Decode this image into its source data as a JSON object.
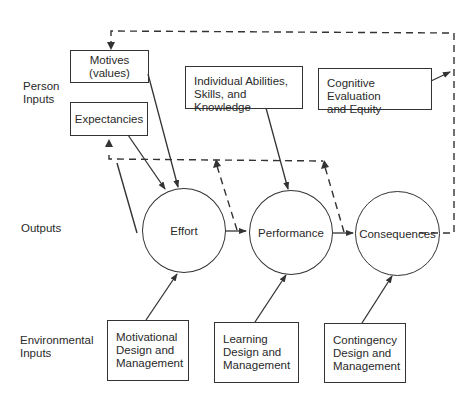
{
  "diagram": {
    "row_labels": {
      "person_inputs": [
        "Person",
        "Inputs"
      ],
      "outputs": "Outputs",
      "environmental_inputs": [
        "Environmental",
        "Inputs"
      ]
    },
    "person_inputs": {
      "motives": [
        "Motives",
        "(values)"
      ],
      "expectancies": "Expectancies",
      "abilities": [
        "Individual Abilities,",
        "Skills, and Knowledge"
      ],
      "cognitive": [
        "Cognitive Evaluation",
        "and Equity"
      ]
    },
    "outputs": {
      "effort": "Effort",
      "performance": "Performance",
      "consequences": "Consequences"
    },
    "environmental_inputs": {
      "motivational": [
        "Motivational",
        "Design and",
        "Management"
      ],
      "learning": [
        "Learning",
        "Design and",
        "Management"
      ],
      "contingency": [
        "Contingency",
        "Design and",
        "Management"
      ]
    },
    "colors": {
      "line": "#333333",
      "text": "#2a2a2a",
      "background": "#ffffff"
    }
  }
}
